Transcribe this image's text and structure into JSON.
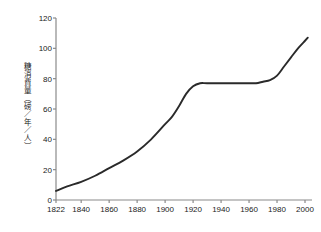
{
  "chart_data": {
    "type": "line",
    "title": "",
    "xlabel": "",
    "ylabel": "糖消費量（磅／年／人）",
    "xlim": [
      1822,
      2005
    ],
    "ylim": [
      0,
      120
    ],
    "grid": false,
    "legend": "none",
    "line_color": "#2a2a2a",
    "background_color": "#ffffff",
    "axis_color": "#8a8a8a",
    "x_ticks": [
      "1822",
      "1840",
      "1860",
      "1880",
      "1900",
      "1920",
      "1940",
      "1960",
      "1980",
      "2000"
    ],
    "x_tick_values": [
      1822,
      1840,
      1860,
      1880,
      1900,
      1920,
      1940,
      1960,
      1980,
      2000
    ],
    "y_ticks": [
      "0",
      "20",
      "40",
      "60",
      "80",
      "100",
      "120"
    ],
    "y_tick_values": [
      0,
      20,
      40,
      60,
      80,
      100,
      120
    ],
    "series": [
      {
        "name": "糖消費量",
        "x": [
          1822,
          1830,
          1840,
          1850,
          1860,
          1870,
          1880,
          1890,
          1900,
          1905,
          1910,
          1915,
          1920,
          1925,
          1930,
          1940,
          1950,
          1960,
          1965,
          1970,
          1975,
          1980,
          1985,
          1990,
          1995,
          2000,
          2002
        ],
        "values": [
          6,
          9,
          12,
          16,
          21,
          26,
          32,
          40,
          50,
          55,
          62,
          70,
          75,
          77,
          77,
          77,
          77,
          77,
          77,
          78,
          79,
          82,
          88,
          94,
          100,
          105,
          107
        ]
      }
    ]
  }
}
